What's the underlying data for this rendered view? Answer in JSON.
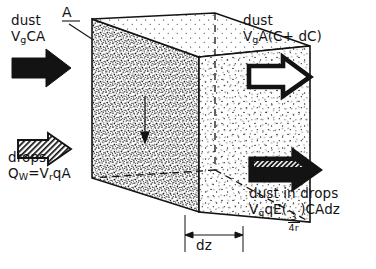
{
  "figure": {
    "type": "schematic-diagram",
    "colors": {
      "ink": "#131313",
      "background": "#ffffff",
      "stipple": "#1a1a1a"
    },
    "box": {
      "label": "A",
      "description": "rectangular control volume drawn in oblique projection, stippled to indicate dust",
      "thickness_label": "dz"
    },
    "flows": [
      {
        "id": "dust-in",
        "side": "left-top",
        "arrow_style": "solid-black",
        "line1": "dust",
        "line2_plain": "VgCA",
        "line2_parts": {
          "v": "V",
          "sub": "g",
          "rest": "CA"
        }
      },
      {
        "id": "dust-out",
        "side": "right-top",
        "arrow_style": "outline-white",
        "line1": "dust",
        "line2_plain": "VgA(C+ dC)",
        "line2_parts": {
          "v": "V",
          "sub": "g",
          "rest": "A(C+ dC)"
        }
      },
      {
        "id": "drops-in",
        "side": "left-bottom",
        "arrow_style": "hatched-outline",
        "line1": "drops",
        "line2_plain": "QW=VrqA",
        "line2_parts": {
          "q": "Q",
          "qsub": "W",
          "eq": "=",
          "v": "V",
          "vsub": "r",
          "rest": "qA"
        }
      },
      {
        "id": "dust-in-drops",
        "side": "right-bottom",
        "arrow_style": "black-with-hatched-shaft",
        "line1": "dust in drops",
        "line2_plain": "VgqE(3/4r)CAdz",
        "line2_parts": {
          "v": "V",
          "sub": "g",
          "mid": "qE(",
          "frac_num": "3",
          "frac_den": "4r",
          "tail": ")CAdz"
        }
      }
    ]
  }
}
